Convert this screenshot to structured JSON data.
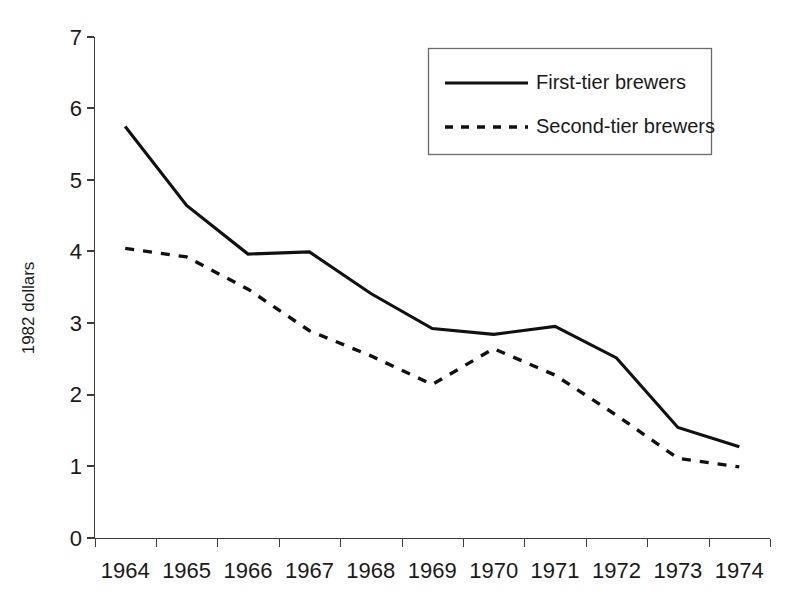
{
  "chart_data": {
    "type": "line",
    "title": "",
    "subtitle": "",
    "xlabel": "",
    "ylabel": "1982 dollars",
    "categories": [
      "1964",
      "1965",
      "1966",
      "1967",
      "1968",
      "1969",
      "1970",
      "1971",
      "1972",
      "1973",
      "1974"
    ],
    "ylim": [
      0,
      7
    ],
    "yticks": [
      0,
      1,
      2,
      3,
      4,
      5,
      6,
      7
    ],
    "ytick_labels": [
      "0",
      "1",
      "2",
      "3",
      "4",
      "5",
      "6",
      "7"
    ],
    "grid": false,
    "legend_position": "top-right",
    "series": [
      {
        "name": "First-tier brewers",
        "style": "solid",
        "color": "#111111",
        "values": [
          5.75,
          4.65,
          3.97,
          4.0,
          3.42,
          2.93,
          2.85,
          2.96,
          2.52,
          1.55,
          1.28
        ]
      },
      {
        "name": "Second-tier brewers",
        "style": "dashed",
        "color": "#111111",
        "values": [
          4.05,
          3.93,
          3.48,
          2.9,
          2.55,
          2.15,
          2.65,
          2.28,
          1.72,
          1.12,
          1.0
        ]
      }
    ]
  },
  "axes": {
    "y_axis_title": "1982 dollars",
    "y_tick_labels": [
      "7",
      "6",
      "5",
      "4",
      "3",
      "2",
      "1",
      "0"
    ],
    "x_tick_labels": [
      "1964",
      "1965",
      "1966",
      "1967",
      "1968",
      "1969",
      "1970",
      "1971",
      "1972",
      "1973",
      "1974"
    ]
  },
  "legend": {
    "entries": [
      {
        "label": "First-tier brewers",
        "style": "solid"
      },
      {
        "label": "Second-tier brewers",
        "style": "dashed"
      }
    ]
  }
}
